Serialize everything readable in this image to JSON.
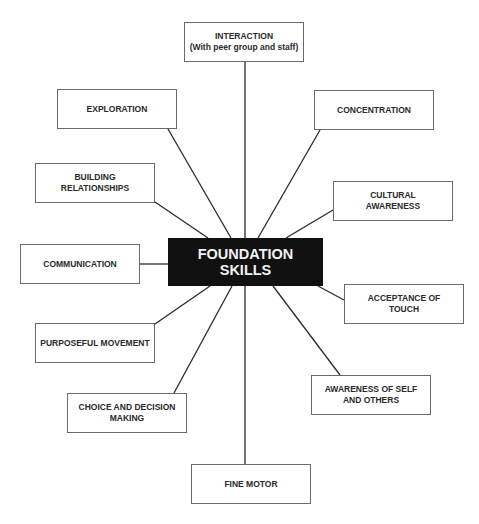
{
  "center": {
    "label": "FOUNDATION\nSKILLS",
    "fill": "#111111",
    "text_color": "#f2f2f2"
  },
  "nodes": [
    {
      "id": "interaction",
      "label": "INTERACTION\n(With peer group and staff)"
    },
    {
      "id": "exploration",
      "label": "EXPLORATION"
    },
    {
      "id": "concentration",
      "label": "CONCENTRATION"
    },
    {
      "id": "building-relationships",
      "label": "BUILDING\nRELATIONSHIPS"
    },
    {
      "id": "cultural-awareness",
      "label": "CULTURAL\nAWARENESS"
    },
    {
      "id": "communication",
      "label": "COMMUNICATION"
    },
    {
      "id": "acceptance-of-touch",
      "label": "ACCEPTANCE OF\nTOUCH"
    },
    {
      "id": "purposeful-movement",
      "label": "PURPOSEFUL MOVEMENT"
    },
    {
      "id": "choice-and-decision-making",
      "label": "CHOICE AND DECISION\nMAKING"
    },
    {
      "id": "awareness-of-self-and-others",
      "label": "AWARENESS OF SELF\nAND OTHERS"
    },
    {
      "id": "fine-motor",
      "label": "FINE MOTOR"
    }
  ]
}
